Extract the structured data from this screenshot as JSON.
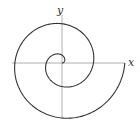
{
  "figure": {
    "type": "archimedean-spiral",
    "x_label": "x",
    "y_label": "y",
    "colors": {
      "curve": "#333333",
      "axes": "#9a9a9a",
      "background": "#ffffff"
    },
    "spiral": {
      "a": 5,
      "theta_start": 0,
      "theta_end_turns": 2
    }
  }
}
